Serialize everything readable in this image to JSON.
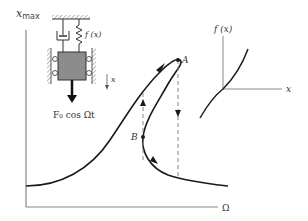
{
  "figure": {
    "y_axis_label": "x",
    "y_axis_label_sub": "max",
    "x_axis_label": "Ω",
    "point_a_label": "A",
    "point_b_label": "B"
  },
  "inset_system": {
    "spring_label": "f (x)",
    "displacement_label": "x",
    "force_label": "F₀ cos Ωt"
  },
  "inset_stiffness": {
    "y_axis_label": "f (x)",
    "x_axis_label": "x"
  },
  "colors": {
    "curve": "#1a1a1a",
    "axis": "#888888",
    "mass": "#8c8c8c",
    "dashed": "#888888"
  }
}
